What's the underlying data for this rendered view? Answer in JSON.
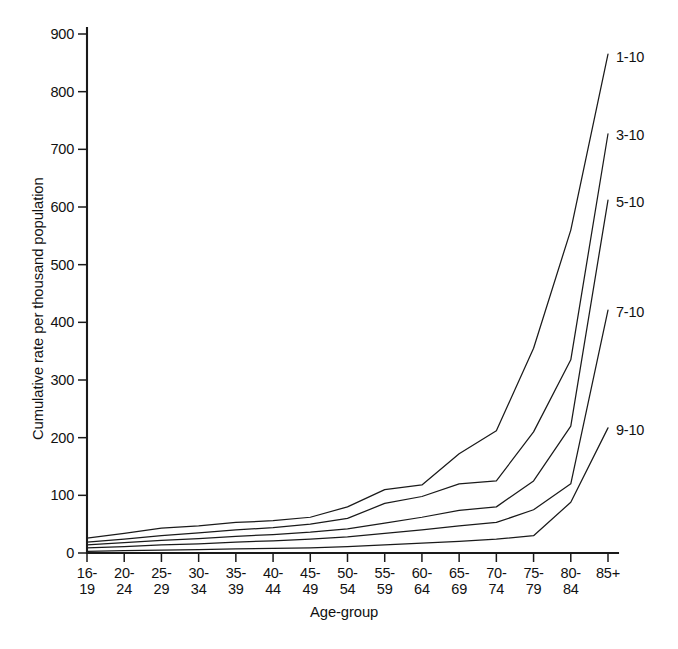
{
  "chart_data": {
    "type": "line",
    "title": "",
    "xlabel": "Age-group",
    "ylabel": "Cumulative rate per thousand population",
    "categories": [
      "16-\n19",
      "20-\n24",
      "25-\n29",
      "30-\n34",
      "35-\n39",
      "40-\n44",
      "45-\n49",
      "50-\n54",
      "55-\n59",
      "60-\n64",
      "65-\n69",
      "70-\n74",
      "75-\n79",
      "80-\n84",
      "85+"
    ],
    "category_labels_flat": [
      "16-19",
      "20-24",
      "25-29",
      "30-34",
      "35-39",
      "40-44",
      "45-49",
      "50-54",
      "55-59",
      "60-64",
      "65-69",
      "70-74",
      "75-79",
      "80-84",
      "85+"
    ],
    "xlim": [
      0,
      14
    ],
    "ylim": [
      0,
      900
    ],
    "yticks": [
      0,
      100,
      200,
      300,
      400,
      500,
      600,
      700,
      800,
      900
    ],
    "ytick_labels": [
      "0",
      "100",
      "200",
      "300",
      "400",
      "500",
      "600",
      "700",
      "800",
      "900"
    ],
    "grid": false,
    "legend_position": "right-inline-labels",
    "series": [
      {
        "name": "1-10",
        "values": [
          26,
          34,
          43,
          47,
          53,
          56,
          62,
          80,
          110,
          118,
          172,
          212,
          355,
          560,
          865
        ]
      },
      {
        "name": "3-10",
        "values": [
          19,
          24,
          30,
          35,
          40,
          44,
          50,
          60,
          86,
          98,
          120,
          125,
          210,
          335,
          727
        ]
      },
      {
        "name": "5-10",
        "values": [
          14,
          18,
          22,
          25,
          29,
          32,
          36,
          42,
          52,
          62,
          74,
          80,
          125,
          220,
          612
        ]
      },
      {
        "name": "7-10",
        "values": [
          9,
          11,
          14,
          16,
          19,
          21,
          24,
          28,
          34,
          40,
          47,
          53,
          75,
          120,
          421
        ]
      },
      {
        "name": "9-10",
        "values": [
          3,
          4,
          5,
          6,
          7,
          8,
          9,
          11,
          14,
          17,
          20,
          24,
          30,
          88,
          217
        ]
      }
    ]
  },
  "axis": {
    "y_title": "Cumulative rate per thousand population",
    "x_title": "Age-group"
  }
}
